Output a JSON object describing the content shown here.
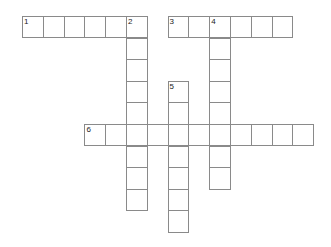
{
  "puzzle": {
    "type": "crossword",
    "grid_origin": {
      "x": 22,
      "y": 16
    },
    "cell_size": {
      "w": 20.8,
      "h": 21.6
    },
    "words": [
      {
        "number": "1",
        "direction": "across",
        "row": 0,
        "col": 0,
        "length": 6
      },
      {
        "number": "2",
        "direction": "down",
        "row": 0,
        "col": 5,
        "length": 9
      },
      {
        "number": "3",
        "direction": "across",
        "row": 0,
        "col": 7,
        "length": 6
      },
      {
        "number": "4",
        "direction": "down",
        "row": 0,
        "col": 9,
        "length": 8
      },
      {
        "number": "5",
        "direction": "down",
        "row": 3,
        "col": 7,
        "length": 7
      },
      {
        "number": "6",
        "direction": "across",
        "row": 5,
        "col": 3,
        "length": 11
      }
    ]
  }
}
